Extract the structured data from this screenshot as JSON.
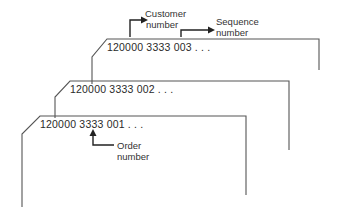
{
  "diagram": {
    "type": "stacked-records",
    "records": [
      {
        "id": "record-3",
        "code": "120000 3333 003 . . ."
      },
      {
        "id": "record-2",
        "code": "120000 3333 002 . . ."
      },
      {
        "id": "record-1",
        "code": "120000 3333 001 . . ."
      }
    ],
    "annotations": {
      "customer": {
        "line1": "Customer",
        "line2": "number"
      },
      "sequence": {
        "line1": "Sequence",
        "line2": "number"
      },
      "order": {
        "line1": "Order",
        "line2": "number"
      }
    },
    "colors": {
      "line": "#555555",
      "text": "#2a2a2a",
      "background": "#ffffff"
    }
  }
}
